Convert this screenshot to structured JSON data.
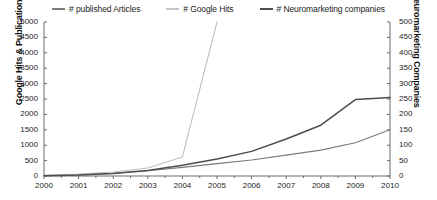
{
  "legend": {
    "position": "top-center",
    "entries": [
      {
        "label": "# published Articles",
        "color": "#7b7b7b",
        "swatch": "legend-line-published-articles"
      },
      {
        "label": "# Google Hits",
        "color": "#c0c0c0",
        "swatch": "legend-line-google-hits"
      },
      {
        "label": "# Neuromarketing companies",
        "color": "#4d4d4d",
        "swatch": "legend-line-neuromarketing-companies"
      }
    ]
  },
  "axes": {
    "left_title": "Google Hits & Publications",
    "right_title": "Neuromarketing Companies",
    "x_title": "",
    "left_ticks": [
      "0",
      "500",
      "1000",
      "1500",
      "2000",
      "2500",
      "3000",
      "3500",
      "4000",
      "4500",
      "5000"
    ],
    "right_ticks": [
      "0",
      "50",
      "100",
      "150",
      "200",
      "250",
      "300",
      "350",
      "400",
      "450",
      "500"
    ],
    "x_ticks": [
      "2000",
      "2001",
      "2002",
      "2003",
      "2004",
      "2005",
      "2006",
      "2007",
      "2008",
      "2009",
      "2010"
    ]
  },
  "chart_data": {
    "type": "line",
    "title": "",
    "subtitle": "",
    "xlabel": "",
    "ylabel": "Google Hits & Publications",
    "y2label": "Neuromarketing Companies",
    "categories": [
      "2000",
      "2001",
      "2002",
      "2003",
      "2004",
      "2005",
      "2006",
      "2007",
      "2008",
      "2009",
      "2010"
    ],
    "ylim": [
      0,
      5000
    ],
    "y2lim": [
      0,
      500
    ],
    "grid": false,
    "legend_position": "top-center",
    "series": [
      {
        "name": "# published Articles",
        "axis": "left",
        "color": "#7b7b7b",
        "values": [
          10,
          40,
          90,
          170,
          280,
          400,
          520,
          680,
          840,
          1080,
          1500
        ]
      },
      {
        "name": "# Google Hits",
        "axis": "left",
        "color": "#c0c0c0",
        "clipped_above_axis_max": true,
        "values": [
          20,
          60,
          130,
          260,
          620,
          5000,
          null,
          null,
          null,
          null,
          null
        ]
      },
      {
        "name": "# Neuromarketing companies",
        "axis": "right",
        "color": "#4d4d4d",
        "values": [
          1,
          3,
          8,
          18,
          35,
          55,
          80,
          120,
          165,
          248,
          255
        ]
      }
    ]
  }
}
